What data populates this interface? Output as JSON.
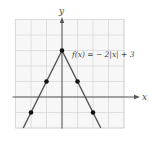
{
  "chart_data": {
    "type": "line",
    "title": "",
    "function_label": "f(x) = − 2|x| + 3",
    "xlabel": "x",
    "ylabel": "y",
    "xlim": [
      -3,
      4
    ],
    "ylim": [
      -2,
      5
    ],
    "grid": true,
    "series": [
      {
        "name": "f(x) = -2|x| + 3",
        "x": [
          -2.5,
          -2,
          -1,
          0,
          1,
          2,
          2.5
        ],
        "y": [
          -2,
          -1,
          1,
          3,
          1,
          -1,
          -2
        ]
      }
    ],
    "points": [
      {
        "x": -2,
        "y": -1
      },
      {
        "x": -1,
        "y": 1
      },
      {
        "x": 0,
        "y": 3
      },
      {
        "x": 1,
        "y": 1
      },
      {
        "x": 2,
        "y": -1
      }
    ],
    "colors": {
      "grid": "#d8d8d8",
      "grid_bg": "#f7f7f7",
      "axis": "#555555",
      "line": "#555555",
      "point": "#111111"
    }
  }
}
